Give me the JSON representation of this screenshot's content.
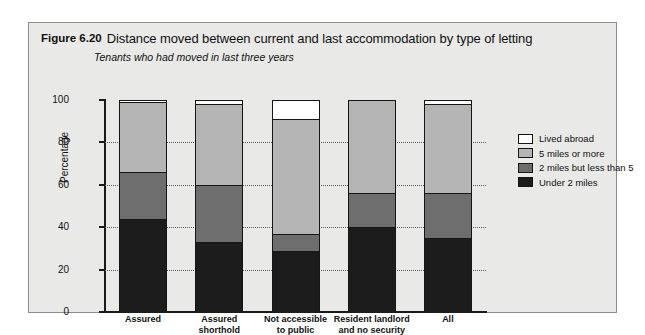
{
  "figure": {
    "number": "Figure 6.20",
    "title": "Distance moved between current and last accommodation by type of letting",
    "subtitle": "Tenants who had moved in last three years"
  },
  "legend": {
    "items": [
      {
        "label": "Lived abroad",
        "color": "#ffffff"
      },
      {
        "label": "5 miles or more",
        "color": "#b4b4b4"
      },
      {
        "label": "2 miles but less than 5",
        "color": "#6e6e6e"
      },
      {
        "label": "Under 2 miles",
        "color": "#1c1c1c"
      }
    ]
  },
  "axes": {
    "ylabel": "Percentage",
    "yticks": [
      "0",
      "20",
      "40",
      "60",
      "80",
      "100"
    ]
  },
  "chart_data": {
    "type": "bar",
    "title": "Distance moved between current and last accommodation by type of letting",
    "subtitle": "Tenants who had moved in last three years",
    "stacked": true,
    "xlabel": "",
    "ylabel": "Percentage",
    "ylim": [
      0,
      100
    ],
    "ytick_step": 20,
    "grid": true,
    "legend_position": "right",
    "categories": [
      "Assured",
      "Assured shorthold",
      "Not accessible to public",
      "Resident landlord and no security",
      "All"
    ],
    "category_lines": [
      [
        "Assured"
      ],
      [
        "Assured",
        "shorthold"
      ],
      [
        "Not accessible",
        "to public"
      ],
      [
        "Resident landlord",
        "and no security"
      ],
      [
        "All"
      ]
    ],
    "series": [
      {
        "name": "Under 2 miles",
        "color": "#1c1c1c",
        "values": [
          44,
          33,
          29,
          40,
          35
        ]
      },
      {
        "name": "2 miles but less than 5",
        "color": "#6e6e6e",
        "values": [
          22,
          27,
          8,
          16,
          21
        ]
      },
      {
        "name": "5 miles or more",
        "color": "#b4b4b4",
        "values": [
          33,
          38,
          54,
          44,
          42
        ]
      },
      {
        "name": "Lived abroad",
        "color": "#ffffff",
        "values": [
          1,
          2,
          9,
          0,
          2
        ]
      }
    ]
  }
}
